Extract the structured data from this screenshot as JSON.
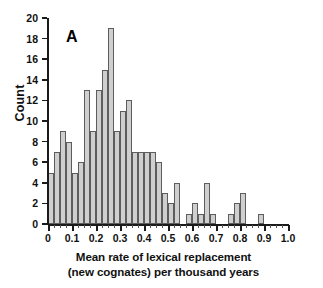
{
  "panel": {
    "label": "A"
  },
  "chart_data": {
    "type": "bar",
    "title": "",
    "subtitle": "",
    "xlabel": "Mean rate of lexical replacement (new cognates) per thousand years",
    "xlabel_line1": "Mean rate of lexical replacement",
    "xlabel_line2": "(new cognates) per thousand years",
    "ylabel": "Count",
    "xlim": [
      0,
      1.0
    ],
    "ylim": [
      0,
      20
    ],
    "bin_width": 0.025,
    "grid": false,
    "legend": null,
    "bar_fill_color": "#cfcfcf",
    "bar_edge_color": "#5d5d5d",
    "x_tick_labels": [
      "0",
      "0.1",
      "0.2",
      "0.3",
      "0.4",
      "0.5",
      "0.6",
      "0.7",
      "0.8",
      "0.9",
      "1.0"
    ],
    "x_tick_values": [
      0,
      0.1,
      0.2,
      0.3,
      0.4,
      0.5,
      0.6,
      0.7,
      0.8,
      0.9,
      1.0
    ],
    "x_minor_tick_step": 0.025,
    "y_tick_labels": [
      "0",
      "2",
      "4",
      "6",
      "8",
      "10",
      "12",
      "14",
      "16",
      "18",
      "20"
    ],
    "y_tick_values": [
      0,
      2,
      4,
      6,
      8,
      10,
      12,
      14,
      16,
      18,
      20
    ],
    "bin_starts": [
      0.0,
      0.025,
      0.05,
      0.075,
      0.1,
      0.125,
      0.15,
      0.175,
      0.2,
      0.225,
      0.25,
      0.275,
      0.3,
      0.325,
      0.35,
      0.375,
      0.4,
      0.425,
      0.45,
      0.475,
      0.5,
      0.525,
      0.55,
      0.575,
      0.6,
      0.625,
      0.65,
      0.675,
      0.7,
      0.725,
      0.75,
      0.775,
      0.8,
      0.825,
      0.85,
      0.875,
      0.9,
      0.925,
      0.95,
      0.975
    ],
    "values": [
      5,
      7,
      9,
      8,
      5,
      6,
      13,
      9,
      13,
      15,
      19,
      9,
      11,
      12,
      7,
      7,
      7,
      7,
      6,
      3,
      2,
      4,
      0,
      1,
      2,
      1,
      4,
      1,
      0,
      0,
      1,
      2,
      3,
      0,
      0,
      1,
      0,
      0,
      0,
      0
    ]
  }
}
